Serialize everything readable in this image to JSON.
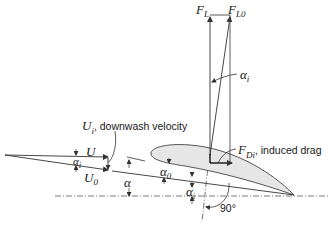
{
  "diagram": {
    "colors": {
      "line": "#333333",
      "airfoil_fill": "#e6e6e6",
      "airfoil_stroke": "#444444",
      "background": "#ffffff"
    },
    "labels": {
      "lift": {
        "sym": "F",
        "sub": "L"
      },
      "lift_zero": {
        "sym": "F",
        "sub": "L0"
      },
      "alpha_i_top": {
        "sym": "α",
        "sub": "i"
      },
      "downwash": {
        "sym": "U",
        "sub": "i",
        "text": ", downwash velocity"
      },
      "induced_drag": {
        "sym": "F",
        "sub": "Di",
        "text": ", induced drag"
      },
      "U": {
        "sym": "U"
      },
      "U0": {
        "sym": "U",
        "sub": "0"
      },
      "alpha_i_left": {
        "sym": "α",
        "sub": "i"
      },
      "alpha": {
        "sym": "α"
      },
      "alpha_0": {
        "sym": "α",
        "sub": "0"
      },
      "alpha_i_bottom": {
        "sym": "α",
        "sub": "i"
      },
      "right_angle": {
        "text": "90°"
      }
    }
  }
}
